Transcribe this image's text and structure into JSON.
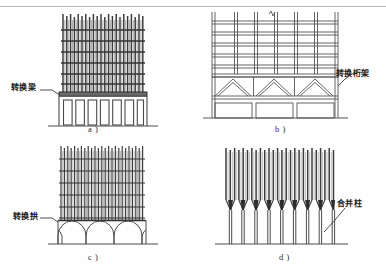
{
  "figure": {
    "domain_note": "scanned technical diagram of building transfer structures",
    "bottom_caption": ""
  },
  "panels": [
    {
      "id": "a",
      "caption": "a )",
      "label": "转换梁",
      "label_meaning": "transfer beam",
      "structure": "shear-wall tower over transfer beam on open podium",
      "upper_walls": 22,
      "upper_floor_lines": 7,
      "podium_bays": 7
    },
    {
      "id": "b",
      "caption": "b )",
      "label": "转换桁架",
      "label_meaning": "transfer truss",
      "structure": "frame grid over transfer truss storey on open podium",
      "frame_columns": 6,
      "frame_rows": 6,
      "truss_bays": 3,
      "podium_bays": 3
    },
    {
      "id": "c",
      "caption": "c )",
      "label": "转换拱",
      "label_meaning": "transfer arch",
      "structure": "dense wall tower over arcade of transfer arches",
      "upper_walls": 24,
      "upper_floor_lines": 6,
      "arches": 4
    },
    {
      "id": "d",
      "caption": "d )",
      "label": "合并柱",
      "label_meaning": "merged column",
      "structure": "dense upper columns funnelling into fewer lower columns",
      "upper_columns": 28,
      "lower_columns": 14
    }
  ],
  "colors": {
    "ink": "#2b2b2b",
    "ink_light": "#6f6f6f",
    "rule": "#b9b9b9",
    "paper": "#fefefe",
    "wall_dark": "#3a3a3a",
    "wall_mid": "#7a7a7a"
  }
}
